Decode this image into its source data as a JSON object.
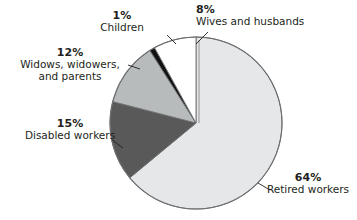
{
  "chart_data": {
    "type": "pie",
    "title": "",
    "subtitle": "",
    "xlabel": "",
    "ylabel": "",
    "legend_position": "none",
    "grid": false,
    "start_angle_deg": 0,
    "direction": "clockwise",
    "units": "percent",
    "total": 100,
    "categories": [
      "Retired workers",
      "Disabled workers",
      "Widows, widowers, and parents",
      "Children",
      "Wives and husbands"
    ],
    "values": [
      64,
      15,
      12,
      1,
      8
    ],
    "slices": [
      {
        "key": "retired",
        "label": "Retired workers",
        "label_lines": [
          "Retired workers"
        ],
        "percent_text": "64%",
        "value": 64,
        "color": "#e5e7e8",
        "start_deg": 0,
        "end_deg": 230.4
      },
      {
        "key": "disabled",
        "label": "Disabled workers",
        "label_lines": [
          "Disabled workers"
        ],
        "percent_text": "15%",
        "value": 15,
        "color": "#595959",
        "start_deg": 230.4,
        "end_deg": 284.4
      },
      {
        "key": "widows",
        "label": "Widows, widowers, and parents",
        "label_lines": [
          "Widows, widowers,",
          "and parents"
        ],
        "percent_text": "12%",
        "value": 12,
        "color": "#b8bbbc",
        "start_deg": 284.4,
        "end_deg": 327.6
      },
      {
        "key": "children",
        "label": "Children",
        "label_lines": [
          "Children"
        ],
        "percent_text": "1%",
        "value": 1,
        "color": "#111111",
        "start_deg": 327.6,
        "end_deg": 331.2
      },
      {
        "key": "wives",
        "label": "Wives and husbands",
        "label_lines": [
          "Wives and husbands"
        ],
        "percent_text": "8%",
        "value": 8,
        "color": "#ffffff",
        "start_deg": 331.2,
        "end_deg": 360
      }
    ]
  },
  "colors": {
    "background": "#ffffff",
    "text": "#231f20",
    "outline": "#6d6e71",
    "leader": "#231f20"
  },
  "labels": {
    "wives": {
      "percent": "8%",
      "line1": "Wives and husbands"
    },
    "children": {
      "percent": "1%",
      "line1": "Children"
    },
    "widows": {
      "percent": "12%",
      "line1": "Widows, widowers,",
      "line2": "and parents"
    },
    "disabled": {
      "percent": "15%",
      "line1": "Disabled workers"
    },
    "retired": {
      "percent": "64%",
      "line1": "Retired workers"
    }
  }
}
